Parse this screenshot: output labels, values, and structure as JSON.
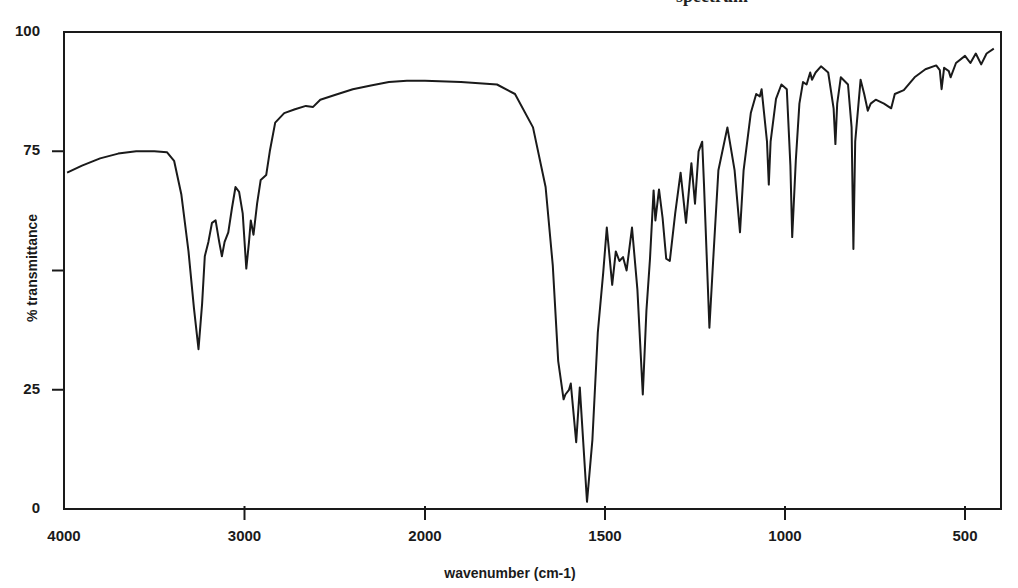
{
  "page": {
    "title_partial": "spectrum"
  },
  "axes": {
    "x_title": "wavenumber (cm-1)",
    "y_title": "% transmittance",
    "y_tick_labels": [
      {
        "value": 100,
        "label": "100"
      },
      {
        "value": 75,
        "label": "75"
      },
      {
        "value": 50,
        "label": ""
      },
      {
        "value": 25,
        "label": "25"
      },
      {
        "value": 0,
        "label": "0"
      }
    ],
    "x_tick_labels": [
      {
        "value": 4000,
        "label": "4000"
      },
      {
        "value": 3000,
        "label": "3000"
      },
      {
        "value": 2000,
        "label": "2000"
      },
      {
        "value": 1500,
        "label": "1500"
      },
      {
        "value": 1000,
        "label": "1000"
      },
      {
        "value": 500,
        "label": "500"
      }
    ]
  },
  "style": {
    "line_color": "#1a1a1a",
    "frame_color": "#1a1a1a",
    "background": "#ffffff"
  },
  "chart_data": {
    "type": "line",
    "title": "",
    "xlabel": "wavenumber (cm-1)",
    "ylabel": "% transmittance",
    "xlim": [
      4000,
      400
    ],
    "ylim": [
      0,
      100
    ],
    "x_scale_note": "scale changes at 2000 cm-1 (expanded below 2000)",
    "grid": false,
    "series": [
      {
        "name": "IR spectrum",
        "points": [
          [
            3983,
            70.5
          ],
          [
            3900,
            72.0
          ],
          [
            3800,
            73.5
          ],
          [
            3700,
            74.5
          ],
          [
            3600,
            75.0
          ],
          [
            3500,
            75.0
          ],
          [
            3430,
            74.8
          ],
          [
            3390,
            73.0
          ],
          [
            3350,
            66.0
          ],
          [
            3310,
            54.0
          ],
          [
            3280,
            42.0
          ],
          [
            3255,
            33.5
          ],
          [
            3235,
            43.0
          ],
          [
            3220,
            53.0
          ],
          [
            3200,
            56.0
          ],
          [
            3180,
            60.0
          ],
          [
            3160,
            60.5
          ],
          [
            3140,
            56.0
          ],
          [
            3125,
            53.0
          ],
          [
            3110,
            56.0
          ],
          [
            3090,
            58.0
          ],
          [
            3070,
            63.0
          ],
          [
            3050,
            67.5
          ],
          [
            3030,
            66.5
          ],
          [
            3010,
            62.0
          ],
          [
            2990,
            50.4
          ],
          [
            2975,
            56.0
          ],
          [
            2965,
            60.5
          ],
          [
            2950,
            57.5
          ],
          [
            2930,
            64.0
          ],
          [
            2910,
            69.0
          ],
          [
            2880,
            70.0
          ],
          [
            2860,
            75.0
          ],
          [
            2830,
            81.0
          ],
          [
            2780,
            83.0
          ],
          [
            2720,
            83.8
          ],
          [
            2660,
            84.5
          ],
          [
            2620,
            84.3
          ],
          [
            2580,
            85.8
          ],
          [
            2500,
            86.8
          ],
          [
            2400,
            88.0
          ],
          [
            2300,
            88.8
          ],
          [
            2200,
            89.5
          ],
          [
            2100,
            89.8
          ],
          [
            2000,
            89.8
          ],
          [
            1900,
            89.5
          ],
          [
            1800,
            89.0
          ],
          [
            1750,
            87.0
          ],
          [
            1700,
            80.0
          ],
          [
            1665,
            67.5
          ],
          [
            1645,
            51.0
          ],
          [
            1630,
            31.0
          ],
          [
            1615,
            23.0
          ],
          [
            1610,
            24.0
          ],
          [
            1600,
            25.0
          ],
          [
            1595,
            26.3
          ],
          [
            1580,
            14.0
          ],
          [
            1570,
            25.5
          ],
          [
            1550,
            1.5
          ],
          [
            1535,
            14.5
          ],
          [
            1520,
            37.0
          ],
          [
            1505,
            49.5
          ],
          [
            1495,
            59.0
          ],
          [
            1480,
            47.0
          ],
          [
            1470,
            54.0
          ],
          [
            1460,
            52.0
          ],
          [
            1450,
            52.8
          ],
          [
            1440,
            50.0
          ],
          [
            1425,
            59.0
          ],
          [
            1410,
            46.0
          ],
          [
            1395,
            24.0
          ],
          [
            1385,
            41.5
          ],
          [
            1375,
            52.5
          ],
          [
            1365,
            66.8
          ],
          [
            1360,
            60.5
          ],
          [
            1350,
            67.0
          ],
          [
            1340,
            61.0
          ],
          [
            1330,
            52.5
          ],
          [
            1320,
            52.0
          ],
          [
            1305,
            62.0
          ],
          [
            1290,
            70.5
          ],
          [
            1275,
            60.0
          ],
          [
            1260,
            72.5
          ],
          [
            1250,
            64.0
          ],
          [
            1240,
            75.0
          ],
          [
            1230,
            77.0
          ],
          [
            1225,
            68.0
          ],
          [
            1210,
            38.0
          ],
          [
            1200,
            51.5
          ],
          [
            1185,
            71.0
          ],
          [
            1160,
            80.0
          ],
          [
            1140,
            71.0
          ],
          [
            1125,
            58.0
          ],
          [
            1115,
            71.0
          ],
          [
            1095,
            83.0
          ],
          [
            1080,
            87.0
          ],
          [
            1070,
            86.5
          ],
          [
            1065,
            88.0
          ],
          [
            1050,
            77.0
          ],
          [
            1045,
            68.0
          ],
          [
            1040,
            77.0
          ],
          [
            1025,
            86.0
          ],
          [
            1010,
            89.0
          ],
          [
            995,
            88.0
          ],
          [
            985,
            72.0
          ],
          [
            980,
            57.0
          ],
          [
            970,
            73.0
          ],
          [
            960,
            85.0
          ],
          [
            950,
            89.5
          ],
          [
            940,
            89.0
          ],
          [
            930,
            91.5
          ],
          [
            925,
            90.0
          ],
          [
            915,
            91.5
          ],
          [
            900,
            92.8
          ],
          [
            880,
            91.5
          ],
          [
            865,
            84.0
          ],
          [
            860,
            76.5
          ],
          [
            855,
            85.0
          ],
          [
            845,
            90.5
          ],
          [
            825,
            89.0
          ],
          [
            815,
            80.0
          ],
          [
            810,
            54.5
          ],
          [
            805,
            77.0
          ],
          [
            790,
            90.0
          ],
          [
            780,
            87.0
          ],
          [
            770,
            83.5
          ],
          [
            762,
            85.0
          ],
          [
            748,
            85.8
          ],
          [
            725,
            85.0
          ],
          [
            705,
            84.0
          ],
          [
            695,
            87.0
          ],
          [
            670,
            87.8
          ],
          [
            640,
            90.5
          ],
          [
            610,
            92.2
          ],
          [
            580,
            93.0
          ],
          [
            570,
            92.0
          ],
          [
            565,
            88.0
          ],
          [
            558,
            92.5
          ],
          [
            545,
            91.8
          ],
          [
            540,
            90.5
          ],
          [
            525,
            93.5
          ],
          [
            500,
            95.0
          ],
          [
            485,
            93.5
          ],
          [
            470,
            95.5
          ],
          [
            455,
            93.2
          ],
          [
            440,
            95.5
          ],
          [
            420,
            96.5
          ]
        ]
      }
    ],
    "axis_pixel_map": {
      "x": [
        [
          4000,
          64
        ],
        [
          2000,
          425
        ],
        [
          400,
          1001
        ]
      ],
      "y": [
        [
          100,
          32
        ],
        [
          0,
          509
        ]
      ]
    }
  }
}
